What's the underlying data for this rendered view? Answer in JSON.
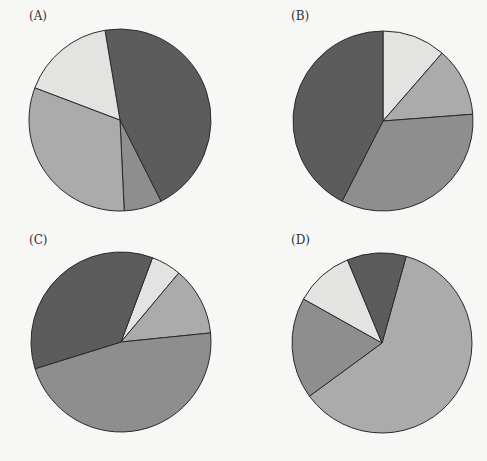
{
  "colors": {
    "dark": "#5c5c5c",
    "medium": "#8e8e8e",
    "medium_light": "#ababab",
    "lightest": "#e3e3e1",
    "stroke": "#2a2a2a"
  },
  "chart_data": [
    {
      "type": "pie",
      "title": "(A)",
      "start_angle_deg": 350.5,
      "direction": "clockwise",
      "slices": [
        {
          "shade": "dark",
          "percent": 45.2
        },
        {
          "shade": "medium",
          "percent": 6.7
        },
        {
          "shade": "medium_light",
          "percent": 31.5
        },
        {
          "shade": "lightest",
          "percent": 16.6
        }
      ]
    },
    {
      "type": "pie",
      "title": "(B)",
      "start_angle_deg": 0,
      "direction": "clockwise",
      "slices": [
        {
          "shade": "lightest",
          "percent": 11.4
        },
        {
          "shade": "medium_light",
          "percent": 12.4
        },
        {
          "shade": "medium",
          "percent": 33.7
        },
        {
          "shade": "dark",
          "percent": 42.5
        }
      ]
    },
    {
      "type": "pie",
      "title": "(C)",
      "start_angle_deg": 20.5,
      "direction": "clockwise",
      "slices": [
        {
          "shade": "lightest",
          "percent": 5.4
        },
        {
          "shade": "medium_light",
          "percent": 12.3
        },
        {
          "shade": "medium",
          "percent": 46.8
        },
        {
          "shade": "dark",
          "percent": 35.5
        }
      ]
    },
    {
      "type": "pie",
      "title": "(D)",
      "start_angle_deg": 15.6,
      "direction": "clockwise",
      "slices": [
        {
          "shade": "medium_light",
          "percent": 60.6
        },
        {
          "shade": "medium",
          "percent": 18.2
        },
        {
          "shade": "lightest",
          "percent": 10.6
        },
        {
          "shade": "dark",
          "percent": 10.6
        }
      ]
    }
  ],
  "layout": {
    "pies": [
      {
        "cx": 120,
        "cy": 120,
        "r": 91,
        "label_x": 29,
        "label_y": 9
      },
      {
        "cx": 383,
        "cy": 121,
        "r": 90,
        "label_x": 291,
        "label_y": 9
      },
      {
        "cx": 121,
        "cy": 342,
        "r": 90,
        "label_x": 29,
        "label_y": 233
      },
      {
        "cx": 382,
        "cy": 343,
        "r": 90,
        "label_x": 291,
        "label_y": 233
      }
    ]
  }
}
